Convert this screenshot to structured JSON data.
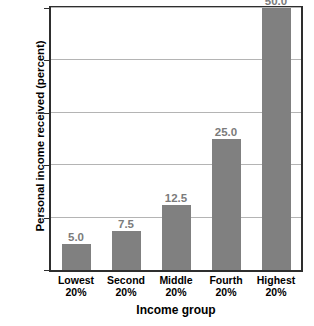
{
  "chart_data": {
    "type": "bar",
    "title": "",
    "xlabel": "Income group",
    "ylabel": "Personal income received (percent)",
    "categories": [
      "Lowest 20%",
      "Second 20%",
      "Middle 20%",
      "Fourth 20%",
      "Highest 20%"
    ],
    "category_lines": [
      [
        "Lowest",
        "20%"
      ],
      [
        "Second",
        "20%"
      ],
      [
        "Middle",
        "20%"
      ],
      [
        "Fourth",
        "20%"
      ],
      [
        "Highest",
        "20%"
      ]
    ],
    "values": [
      5.0,
      7.5,
      12.5,
      25.0,
      50.0
    ],
    "value_labels": [
      "5.0",
      "7.5",
      "12.5",
      "25.0",
      "50.0"
    ],
    "ylim": [
      0,
      50
    ],
    "yticks": [
      0,
      10,
      20,
      30,
      40,
      50
    ],
    "ytick_labels": [
      "0",
      "10",
      "20",
      "30",
      "40",
      "50"
    ],
    "grid": true,
    "legend": false,
    "bar_color": "#808080",
    "value_label_color": "#7b7b7b",
    "gridline_color": "#b4b4b4",
    "frame_color": "#2e2e2e",
    "background_color": "#ffffff"
  }
}
